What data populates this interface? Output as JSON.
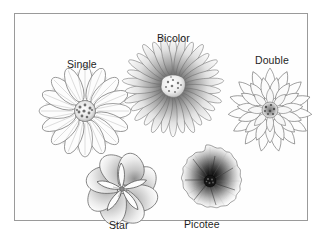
{
  "plate": {
    "title": "Flower Form Types",
    "background_color": "#ffffff",
    "frame_color": "#9a9a9a",
    "ink_color": "#555555",
    "label_color": "#1f1f1f"
  },
  "figures": [
    {
      "id": "single",
      "label": "Single",
      "form": "single",
      "description": "Daisy-like bloom with one row of broad ray petals around a small stippled disc center",
      "petal_count": 16,
      "center_style": "stippled-disc"
    },
    {
      "id": "bicolor",
      "label": "Bicolor",
      "form": "bicolor",
      "description": "Many narrow rays shaded dark at the base fading to pale tips, pale speckled center",
      "petal_count": 30,
      "center_style": "pale-speckled-disc"
    },
    {
      "id": "double",
      "label": "Double",
      "form": "double",
      "description": "Dahlia-type bloom with several overlapping layers of pointed petals and a tight dark center",
      "petal_count": 38,
      "center_style": "tight-dark-cluster"
    },
    {
      "id": "star",
      "label": "Star",
      "form": "star",
      "description": "Broad rounded outer petals with pointed star-shaped inner petals",
      "petal_count": 12,
      "center_style": "pointed-inner-star"
    },
    {
      "id": "picotee",
      "label": "Picotee",
      "form": "picotee",
      "description": "Dense ruffled bloom, very dark toward the center fading to pale frilled margins",
      "petal_count": 24,
      "center_style": "dark-radial-gradient"
    }
  ]
}
